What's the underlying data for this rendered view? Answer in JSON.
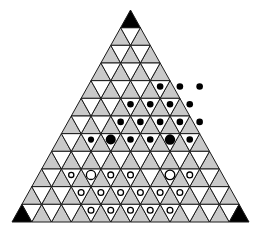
{
  "figure": {
    "type": "triangular-grid-diagram",
    "rows": 12,
    "width": 261,
    "height": 231
  },
  "colors": {
    "background": "#ffffff",
    "up_triangle_fill": "#c9c9c9",
    "down_triangle_fill": "#ffffff",
    "corner_fill": "#000000",
    "stroke": "#1a1a1a",
    "black_marker": "#000000",
    "white_marker_fill": "#ffffff",
    "white_marker_stroke": "#000000"
  },
  "geometry": {
    "apex_x": 130.5,
    "apex_y": 10.0,
    "base_left_x": 12.0,
    "base_right_x": 249.0,
    "base_y": 222.0,
    "row_height": 17.6667,
    "half_width_step": 9.875
  },
  "corners": [
    {
      "name": "apex-corner",
      "row": 0,
      "col": 0,
      "label": "top"
    },
    {
      "name": "bottom-left-corner",
      "row": 11,
      "col": 0,
      "label": "bottom-left"
    },
    {
      "name": "bottom-right-corner",
      "row": 11,
      "col": 11,
      "label": "bottom-right"
    }
  ],
  "markers": {
    "black_rows": [
      {
        "row": 4,
        "cols": [
          3,
          4,
          5
        ],
        "sizes": [
          3.3,
          3.3,
          3.3
        ]
      },
      {
        "row": 5,
        "cols": [
          2,
          3,
          4,
          5
        ],
        "sizes": [
          3.3,
          3.3,
          3.3,
          3.3
        ]
      },
      {
        "row": 6,
        "cols": [
          2,
          3,
          4,
          5,
          6
        ],
        "sizes": [
          3.3,
          3.3,
          3.3,
          3.3,
          3.3
        ]
      },
      {
        "row": 7,
        "cols": [
          1,
          2,
          3,
          4,
          5,
          6
        ],
        "sizes": [
          3.1,
          5.0,
          3.3,
          3.3,
          5.2,
          3.3
        ]
      }
    ],
    "white_rows": [
      {
        "row": 9,
        "cols": [
          1,
          2,
          3,
          4,
          6,
          7
        ],
        "sizes": [
          2.6,
          4.6,
          2.9,
          2.9,
          4.8,
          2.9
        ]
      },
      {
        "row": 10,
        "cols": [
          2,
          3,
          4,
          5,
          6,
          7
        ],
        "sizes": [
          2.9,
          2.9,
          2.9,
          2.9,
          2.9,
          2.9
        ]
      },
      {
        "row": 11,
        "cols": [
          3,
          4,
          5,
          6,
          7
        ],
        "sizes": [
          2.9,
          2.9,
          2.9,
          2.9,
          2.9
        ]
      }
    ]
  },
  "legend": {
    "black_marker_label": "filled site",
    "white_marker_label": "open site",
    "shaded_label": "upward triangle",
    "unshaded_label": "downward triangle"
  }
}
